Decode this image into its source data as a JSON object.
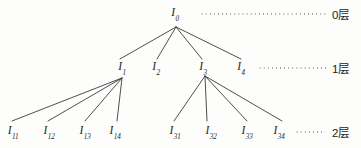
{
  "figure": {
    "type": "hierarchy-tree-diagram",
    "background_color": "#fdfdfc",
    "line_color": "#3a3a3a",
    "text_color": "#262626",
    "width": 361,
    "height": 148
  },
  "levels": [
    {
      "key": "level0",
      "tier_label": "0层",
      "tier_label_x": 332,
      "y": 14,
      "leader": {
        "x": 200,
        "width": 128
      },
      "nodes": [
        {
          "id": "I0",
          "base": "I",
          "sub": "0",
          "x": 175,
          "y": 14
        }
      ]
    },
    {
      "key": "level1",
      "tier_label": "1层",
      "tier_label_x": 332,
      "y": 68,
      "leader": {
        "x": 258,
        "width": 70
      },
      "nodes": [
        {
          "id": "I1",
          "base": "I",
          "sub": "1",
          "x": 122,
          "y": 68
        },
        {
          "id": "I2",
          "base": "I",
          "sub": "2",
          "x": 156,
          "y": 68
        },
        {
          "id": "I3",
          "base": "I",
          "sub": "3",
          "x": 203,
          "y": 68
        },
        {
          "id": "I4",
          "base": "I",
          "sub": "4",
          "x": 241,
          "y": 68
        }
      ]
    },
    {
      "key": "level2",
      "tier_label": "2层",
      "tier_label_x": 332,
      "y": 132,
      "leader": {
        "x": 295,
        "width": 28
      },
      "nodes": [
        {
          "id": "I11",
          "base": "I",
          "sub": "11",
          "x": 13,
          "y": 132
        },
        {
          "id": "I12",
          "base": "I",
          "sub": "12",
          "x": 49,
          "y": 132
        },
        {
          "id": "I13",
          "base": "I",
          "sub": "13",
          "x": 85,
          "y": 132
        },
        {
          "id": "I14",
          "base": "I",
          "sub": "14",
          "x": 115,
          "y": 132
        },
        {
          "id": "I31",
          "base": "I",
          "sub": "31",
          "x": 175,
          "y": 132
        },
        {
          "id": "I32",
          "base": "I",
          "sub": "32",
          "x": 211,
          "y": 132
        },
        {
          "id": "I33",
          "base": "I",
          "sub": "33",
          "x": 247,
          "y": 132
        },
        {
          "id": "I34",
          "base": "I",
          "sub": "34",
          "x": 279,
          "y": 132
        }
      ]
    }
  ],
  "edges": [
    {
      "from": "I0",
      "to": "I1",
      "x1": 176,
      "y1": 27,
      "x2": 120,
      "y2": 59
    },
    {
      "from": "I0",
      "to": "I2",
      "x1": 176,
      "y1": 27,
      "x2": 157,
      "y2": 59
    },
    {
      "from": "I0",
      "to": "I3",
      "x1": 176,
      "y1": 27,
      "x2": 202,
      "y2": 59
    },
    {
      "from": "I0",
      "to": "I4",
      "x1": 176,
      "y1": 27,
      "x2": 241,
      "y2": 59
    },
    {
      "from": "I1",
      "to": "I11",
      "x1": 122,
      "y1": 78,
      "x2": 12,
      "y2": 121
    },
    {
      "from": "I1",
      "to": "I12",
      "x1": 122,
      "y1": 78,
      "x2": 48,
      "y2": 121
    },
    {
      "from": "I1",
      "to": "I13",
      "x1": 122,
      "y1": 78,
      "x2": 85,
      "y2": 121
    },
    {
      "from": "I1",
      "to": "I14",
      "x1": 122,
      "y1": 78,
      "x2": 117,
      "y2": 121
    },
    {
      "from": "I3",
      "to": "I31",
      "x1": 205,
      "y1": 76,
      "x2": 174,
      "y2": 121
    },
    {
      "from": "I3",
      "to": "I32",
      "x1": 205,
      "y1": 76,
      "x2": 207,
      "y2": 121
    },
    {
      "from": "I3",
      "to": "I33",
      "x1": 205,
      "y1": 76,
      "x2": 247,
      "y2": 121
    },
    {
      "from": "I3",
      "to": "I34",
      "x1": 205,
      "y1": 76,
      "x2": 282,
      "y2": 121
    }
  ]
}
